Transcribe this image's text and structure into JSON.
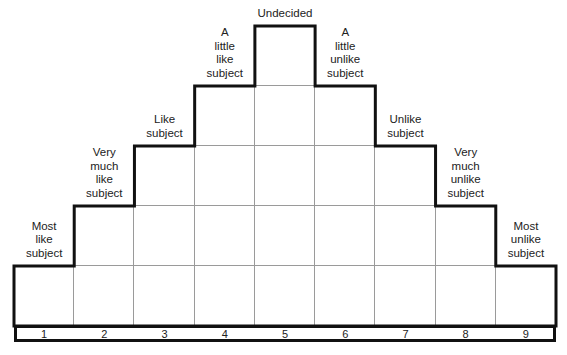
{
  "diagram": {
    "columns": [
      {
        "number": "1",
        "label": "Most\nlike\nsubject",
        "cells": 1
      },
      {
        "number": "2",
        "label": "Very\nmuch\nlike\nsubject",
        "cells": 2
      },
      {
        "number": "3",
        "label": "Like\nsubject",
        "cells": 3
      },
      {
        "number": "4",
        "label": "A\nlittle\nlike\nsubject",
        "cells": 4
      },
      {
        "number": "5",
        "label": "Undecided",
        "cells": 5
      },
      {
        "number": "6",
        "label": "A\nlittle\nunlike\nsubject",
        "cells": 4
      },
      {
        "number": "7",
        "label": "Unlike\nsubject",
        "cells": 3
      },
      {
        "number": "8",
        "label": "Very\nmuch\nunlike\nsubject",
        "cells": 2
      },
      {
        "number": "9",
        "label": "Most\nunlike\nsubject",
        "cells": 1
      }
    ],
    "colors": {
      "outline": "#111111",
      "grid": "#9a9a9a",
      "text": "#222222"
    }
  }
}
